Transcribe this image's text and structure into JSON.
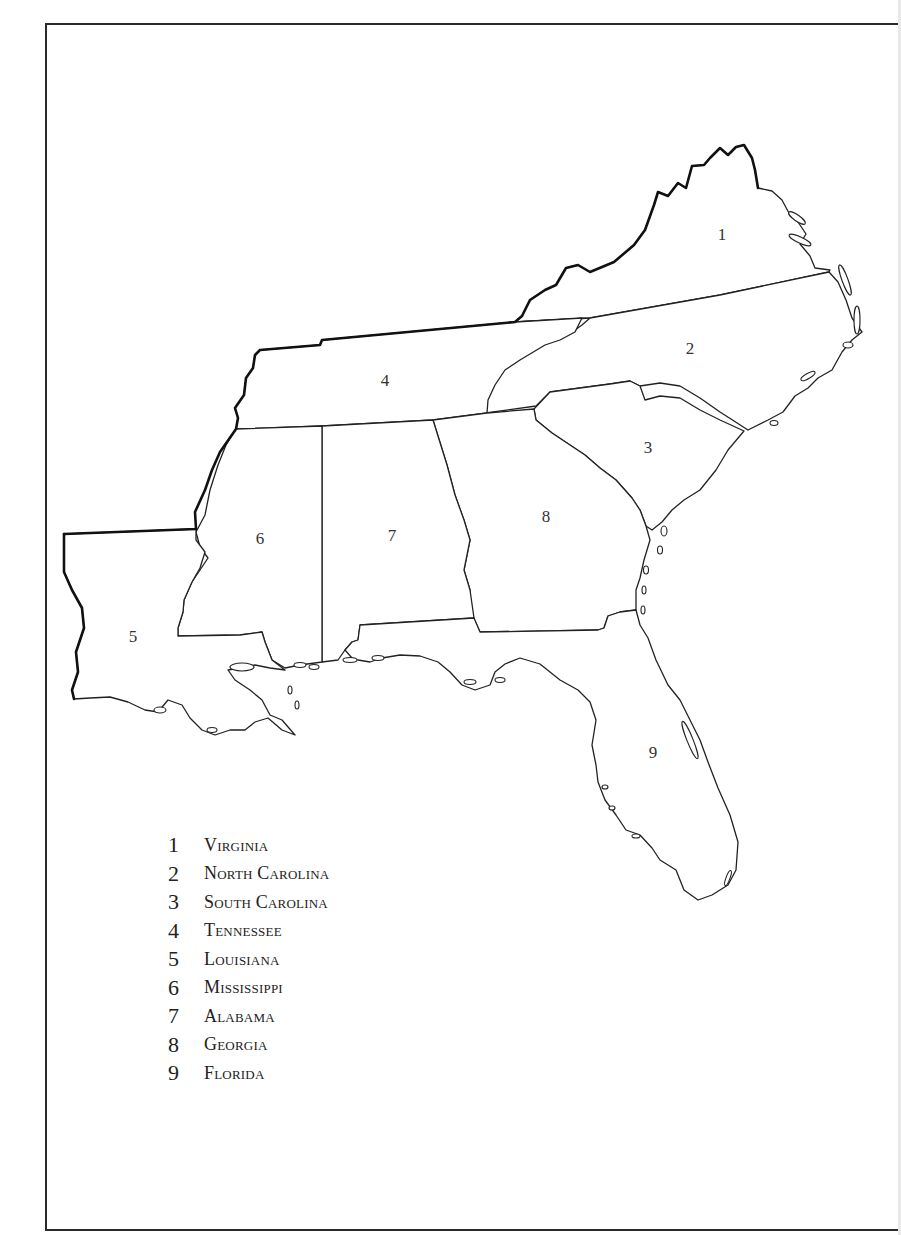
{
  "map": {
    "title": "",
    "region": "Southeastern United States",
    "labels": [
      {
        "id": "1",
        "state": "Virginia",
        "x": 722,
        "y": 235
      },
      {
        "id": "2",
        "state": "North Carolina",
        "x": 690,
        "y": 349
      },
      {
        "id": "3",
        "state": "South Carolina",
        "x": 648,
        "y": 448
      },
      {
        "id": "4",
        "state": "Tennessee",
        "x": 385,
        "y": 381
      },
      {
        "id": "5",
        "state": "Louisiana",
        "x": 133,
        "y": 637
      },
      {
        "id": "6",
        "state": "Mississippi",
        "x": 260,
        "y": 539
      },
      {
        "id": "7",
        "state": "Alabama",
        "x": 392,
        "y": 536
      },
      {
        "id": "8",
        "state": "Georgia",
        "x": 546,
        "y": 517
      },
      {
        "id": "9",
        "state": "Florida",
        "x": 653,
        "y": 753
      }
    ]
  },
  "legend": {
    "items": [
      {
        "num": "1",
        "name": "Virginia"
      },
      {
        "num": "2",
        "name": "North Carolina"
      },
      {
        "num": "3",
        "name": "South Carolina"
      },
      {
        "num": "4",
        "name": "Tennessee"
      },
      {
        "num": "5",
        "name": "Louisiana"
      },
      {
        "num": "6",
        "name": "Mississippi"
      },
      {
        "num": "7",
        "name": "Alabama"
      },
      {
        "num": "8",
        "name": "Georgia"
      },
      {
        "num": "9",
        "name": "Florida"
      }
    ]
  },
  "colors": {
    "ink": "#1a1a1a",
    "paper": "#ffffff",
    "frame": "#2a2a2a"
  }
}
